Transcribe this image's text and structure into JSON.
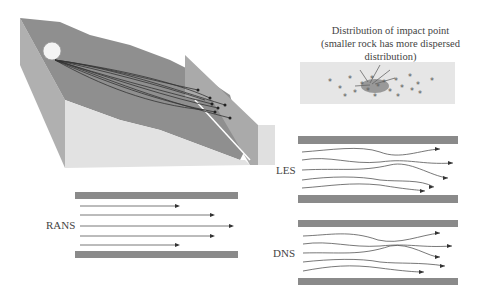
{
  "figure": {
    "distribution_title_line1": "Distribution of impact point",
    "distribution_title_line2": "(smaller rock has more dispersed distribution)",
    "panels": [
      {
        "id": "les",
        "label": "LES"
      },
      {
        "id": "rans",
        "label": "RANS"
      },
      {
        "id": "dns",
        "label": "DNS"
      }
    ]
  },
  "colors": {
    "slope_dark": "#8f8f8f",
    "slope_light": "#b4b4b4",
    "ground": "#e3e3e3",
    "wall": "#a8a8a8",
    "channel_wall": "#8a8a8a",
    "trajectory": "#444444"
  }
}
